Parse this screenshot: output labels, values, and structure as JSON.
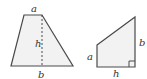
{
  "figure": {
    "trapezoid": {
      "label_top": "a",
      "label_height": "h",
      "label_bottom": "b"
    },
    "right_trapezoid": {
      "label_left": "a",
      "label_right": "b",
      "label_bottom": "h"
    },
    "colors": {
      "fill": "#f2f2f2",
      "stroke": "#4a4a4a"
    }
  }
}
